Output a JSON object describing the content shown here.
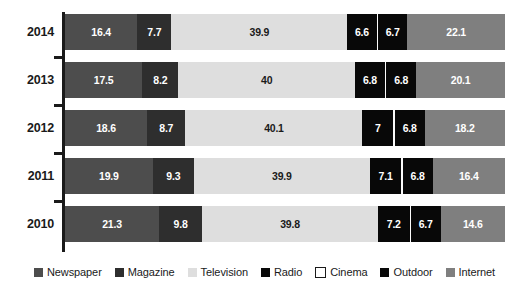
{
  "chart_data": {
    "type": "bar",
    "orientation": "horizontal",
    "stacked": true,
    "stack_mode": "percent",
    "title": "",
    "subtitle": "",
    "xlabel": "",
    "ylabel": "",
    "xlim": [
      0,
      100
    ],
    "grid": false,
    "legend_position": "bottom",
    "categories": [
      "2014",
      "2013",
      "2012",
      "2011",
      "2010"
    ],
    "series": [
      {
        "name": "Newspaper",
        "color": "#4d4d4d",
        "label_color": "#ffffff",
        "values": [
          16.4,
          17.5,
          18.6,
          19.9,
          21.3
        ]
      },
      {
        "name": "Magazine",
        "color": "#2e2e2e",
        "label_color": "#ffffff",
        "values": [
          7.7,
          8.2,
          8.7,
          9.3,
          9.8
        ]
      },
      {
        "name": "Television",
        "color": "#dedede",
        "label_color": "#1a1a1a",
        "values": [
          39.9,
          40,
          40.1,
          39.9,
          39.8
        ]
      },
      {
        "name": "Radio",
        "color": "#080808",
        "label_color": "#ffffff",
        "values": [
          6.6,
          6.8,
          7,
          7.1,
          7.2
        ]
      },
      {
        "name": "Cinema",
        "color": "#fbfbfb",
        "label_color": "#1a1a1a",
        "values": [
          0.3,
          0.3,
          0.3,
          0.3,
          0.3
        ],
        "labels_hidden": true
      },
      {
        "name": "Outdoor",
        "color": "#080808",
        "label_color": "#ffffff",
        "values": [
          6.7,
          6.8,
          6.8,
          6.8,
          6.7
        ]
      },
      {
        "name": "Internet",
        "color": "#7f7f7f",
        "label_color": "#ffffff",
        "values": [
          22.1,
          20.1,
          18.2,
          16.4,
          14.6
        ]
      }
    ],
    "value_labels": {
      "2014": [
        "16.4",
        "7.7",
        "39.9",
        "6.6",
        "",
        "6.7",
        "22.1"
      ],
      "2013": [
        "17.5",
        "8.2",
        "40",
        "6.8",
        "",
        "6.8",
        "20.1"
      ],
      "2012": [
        "18.6",
        "8.7",
        "40.1",
        "7",
        "",
        "6.8",
        "18.2"
      ],
      "2011": [
        "19.9",
        "9.3",
        "39.9",
        "7.1",
        "",
        "6.8",
        "16.4"
      ],
      "2010": [
        "21.3",
        "9.8",
        "39.8",
        "7.2",
        "",
        "6.7",
        "14.6"
      ]
    }
  },
  "axis": {
    "category_labels": [
      "2014",
      "2013",
      "2012",
      "2011",
      "2010"
    ],
    "line_color": "#1a1a1a"
  },
  "legend": {
    "items": [
      {
        "label": "Newspaper",
        "color": "#4d4d4d",
        "outlined": false
      },
      {
        "label": "Magazine",
        "color": "#2e2e2e",
        "outlined": false
      },
      {
        "label": "Television",
        "color": "#dedede",
        "outlined": false
      },
      {
        "label": "Radio",
        "color": "#080808",
        "outlined": false
      },
      {
        "label": "Cinema",
        "color": "#ffffff",
        "outlined": true
      },
      {
        "label": "Outdoor",
        "color": "#080808",
        "outlined": false
      },
      {
        "label": "Internet",
        "color": "#7f7f7f",
        "outlined": false
      }
    ]
  },
  "colors": {
    "background": "#ffffff",
    "text": "#1a1a1a",
    "label_light": "#ffffff"
  }
}
